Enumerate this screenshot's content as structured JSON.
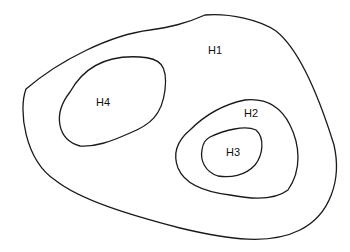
{
  "diagram": {
    "type": "nested-regions",
    "regions": [
      {
        "id": "H1",
        "label": "H1",
        "contains": [
          "H2",
          "H4"
        ]
      },
      {
        "id": "H2",
        "label": "H2",
        "contains": [
          "H3"
        ]
      },
      {
        "id": "H3",
        "label": "H3",
        "contains": []
      },
      {
        "id": "H4",
        "label": "H4",
        "contains": []
      }
    ],
    "stroke_color": "#1a1a1a",
    "background_color": "#ffffff"
  }
}
